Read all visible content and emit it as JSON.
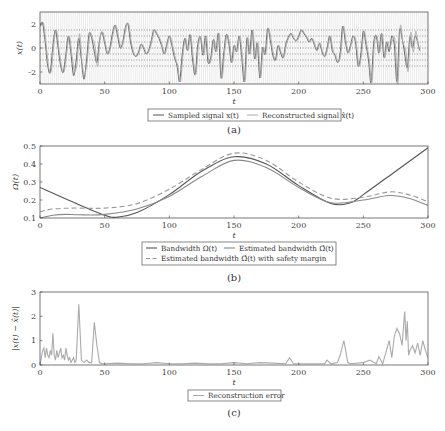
{
  "chart_data": [
    {
      "id": "a",
      "type": "line",
      "caption": "(a)",
      "xlabel": "t",
      "ylabel": "x(t)",
      "xlim": [
        0,
        300
      ],
      "ylim": [
        -3,
        3
      ],
      "xticks": [
        0,
        50,
        100,
        150,
        200,
        250,
        300
      ],
      "yticks": [
        -2,
        0,
        2
      ],
      "grid": "dense vertical sampling lines + dotted horizontal quantization levels",
      "legend": [
        "Sampled signal x(t)",
        "Reconstructed signal x̂(t)"
      ],
      "legend_position": "below",
      "series": [
        {
          "name": "Sampled signal x(t)",
          "color": "#555555",
          "x": [
            0,
            2,
            4,
            6,
            8,
            10,
            12,
            14,
            16,
            18,
            20,
            22,
            24,
            26,
            28,
            30,
            32,
            34,
            36,
            38,
            40,
            42,
            44,
            46,
            48,
            50,
            52,
            54,
            56,
            58,
            60,
            62,
            64,
            66,
            68,
            70,
            72,
            74,
            76,
            78,
            80,
            82,
            84,
            86,
            88,
            90,
            92,
            94,
            96,
            98,
            100,
            102,
            104,
            106,
            108,
            110,
            112,
            114,
            116,
            118,
            120,
            122,
            124,
            126,
            128,
            130,
            132,
            134,
            136,
            138,
            140,
            142,
            144,
            146,
            148,
            150,
            152,
            154,
            156,
            158,
            160,
            162,
            164,
            166,
            168,
            170,
            172,
            174,
            176,
            178,
            180,
            182,
            184,
            186,
            188,
            190,
            192,
            194,
            196,
            198,
            200,
            202,
            204,
            206,
            208,
            210,
            212,
            214,
            216,
            218,
            220,
            222,
            224,
            226,
            228,
            230,
            232,
            234,
            236,
            238,
            240,
            242,
            244,
            246,
            248,
            250,
            252,
            254,
            256,
            258,
            260,
            262,
            264,
            266,
            268,
            270,
            272,
            274,
            276,
            278,
            280,
            282,
            284,
            286,
            288,
            290,
            292,
            294,
            296,
            298,
            300
          ],
          "y": [
            1.8,
            2.1,
            0.5,
            -1.5,
            -2.0,
            0.2,
            1.5,
            0.0,
            -1.5,
            -2.0,
            -0.5,
            1.0,
            -0.5,
            -2.3,
            -1.0,
            0.8,
            -1.0,
            -2.6,
            -1.0,
            1.2,
            0.8,
            -0.3,
            -1.2,
            0.6,
            1.3,
            0.4,
            -0.5,
            0.0,
            1.2,
            1.9,
            1.0,
            0.0,
            0.5,
            1.7,
            2.0,
            0.5,
            -0.4,
            -0.7,
            -0.4,
            0.3,
            0.0,
            -0.5,
            -0.2,
            0.6,
            1.5,
            1.2,
            0.8,
            0.2,
            -0.5,
            0.3,
            1.0,
            0.2,
            -0.8,
            -1.5,
            -2.8,
            -0.5,
            0.8,
            -0.2,
            1.1,
            -1.0,
            -2.2,
            0.3,
            0.9,
            -0.6,
            1.0,
            -1.2,
            -0.8,
            0.7,
            -0.3,
            1.2,
            -2.5,
            -0.5,
            1.1,
            0.4,
            -1.2,
            0.2,
            -0.3,
            1.0,
            -0.8,
            -2.8,
            0.8,
            -0.5,
            1.5,
            -0.9,
            0.4,
            -2.5,
            0.0,
            -0.5,
            1.6,
            0.7,
            -0.6,
            -1.0,
            0.2,
            -0.4,
            -0.8,
            0.3,
            0.9,
            1.2,
            0.8,
            0.6,
            1.0,
            1.5,
            1.2,
            0.9,
            0.5,
            0.8,
            0.3,
            -0.2,
            0.4,
            -0.3,
            -0.7,
            0.0,
            1.0,
            -0.2,
            -0.6,
            -1.2,
            -0.5,
            1.8,
            0.6,
            -0.4,
            0.2,
            1.0,
            0.4,
            -1.5,
            -0.6,
            1.4,
            0.3,
            -1.0,
            -2.9,
            0.4,
            1.0,
            -0.4,
            1.2,
            -0.8,
            0.5,
            -0.3,
            1.0,
            0.2,
            -2.8,
            1.4,
            0.8,
            -0.5,
            -1.6,
            0.9,
            0.0,
            1.0,
            0.5,
            -0.2,
            1.3
          ]
        },
        {
          "name": "Reconstructed signal x̂(t)",
          "color": "#aaaaaa",
          "note": "closely follows sampled signal with deviations near t≈30, 45 and t≈270–300"
        }
      ]
    },
    {
      "id": "b",
      "type": "line",
      "caption": "(b)",
      "xlabel": "t",
      "ylabel": "Ω(t)",
      "xlim": [
        0,
        300
      ],
      "ylim": [
        0.1,
        0.5
      ],
      "xticks": [
        0,
        50,
        100,
        150,
        200,
        250,
        300
      ],
      "yticks": [
        0.1,
        0.2,
        0.3,
        0.4,
        0.5
      ],
      "grid": false,
      "legend": [
        "Bandwidth Ω(t)",
        "Estimated bandwidth Ω̂(t)",
        "Estimated bandwidth Ω̂(t) with safety margin"
      ],
      "legend_position": "below",
      "series": [
        {
          "name": "Bandwidth Ω(t)",
          "color": "#555555",
          "style": "solid",
          "x": [
            0,
            25,
            50,
            60,
            75,
            100,
            125,
            150,
            175,
            200,
            225,
            240,
            250,
            275,
            300
          ],
          "y": [
            0.27,
            0.19,
            0.115,
            0.105,
            0.13,
            0.23,
            0.36,
            0.44,
            0.4,
            0.28,
            0.18,
            0.185,
            0.23,
            0.36,
            0.49
          ]
        },
        {
          "name": "Estimated bandwidth Ω̂(t)",
          "color": "#888888",
          "style": "solid",
          "x": [
            0,
            10,
            20,
            30,
            50,
            75,
            100,
            125,
            150,
            175,
            200,
            225,
            250,
            270,
            285,
            300
          ],
          "y": [
            0.1,
            0.115,
            0.12,
            0.118,
            0.12,
            0.15,
            0.22,
            0.33,
            0.42,
            0.38,
            0.27,
            0.185,
            0.2,
            0.225,
            0.21,
            0.17
          ]
        },
        {
          "name": "Estimated bandwidth Ω̂(t) with safety margin",
          "color": "#999999",
          "style": "dashed",
          "x": [
            0,
            10,
            25,
            50,
            75,
            100,
            125,
            150,
            175,
            200,
            225,
            250,
            270,
            285,
            300
          ],
          "y": [
            0.135,
            0.15,
            0.155,
            0.155,
            0.18,
            0.26,
            0.37,
            0.46,
            0.42,
            0.3,
            0.21,
            0.215,
            0.245,
            0.23,
            0.19
          ]
        }
      ]
    },
    {
      "id": "c",
      "type": "line",
      "caption": "(c)",
      "xlabel": "t",
      "ylabel": "|x(t) − x̂(t)|",
      "xlim": [
        0,
        300
      ],
      "ylim": [
        0,
        3
      ],
      "xticks": [
        0,
        50,
        100,
        150,
        200,
        250,
        300
      ],
      "yticks": [
        0,
        1,
        2,
        3
      ],
      "grid": false,
      "legend": [
        "Reconstruction error"
      ],
      "legend_position": "below",
      "series": [
        {
          "name": "Reconstruction error",
          "color": "#aaaaaa",
          "x": [
            0,
            2,
            3,
            4,
            5,
            6,
            7,
            8,
            9,
            10,
            11,
            12,
            13,
            14,
            15,
            16,
            17,
            18,
            19,
            20,
            21,
            22,
            23,
            24,
            25,
            26,
            27,
            28,
            30,
            32,
            34,
            36,
            38,
            40,
            42,
            44,
            46,
            48,
            50,
            60,
            70,
            80,
            90,
            100,
            110,
            120,
            130,
            140,
            150,
            160,
            170,
            180,
            190,
            193,
            196,
            200,
            210,
            220,
            222,
            225,
            230,
            232,
            235,
            238,
            240,
            250,
            255,
            260,
            262,
            265,
            270,
            272,
            274,
            276,
            278,
            280,
            282,
            283,
            284,
            285,
            286,
            288,
            290,
            292,
            294,
            296,
            298,
            300
          ],
          "y": [
            0,
            0.6,
            0.7,
            0.3,
            0.7,
            0.4,
            0.3,
            0.6,
            0.4,
            1.3,
            0.4,
            0.2,
            0.6,
            0.3,
            0.5,
            0.7,
            0.3,
            0.4,
            0.2,
            0.7,
            0.4,
            0.2,
            0.3,
            0.1,
            0.2,
            0.3,
            0.1,
            0.2,
            2.5,
            0.2,
            0.1,
            0.2,
            0.1,
            0.1,
            1.75,
            0.8,
            0.1,
            0.05,
            0.05,
            0.08,
            0.05,
            0.05,
            0.1,
            0.05,
            0.05,
            0.08,
            0.05,
            0.05,
            0.1,
            0.05,
            0.1,
            0.08,
            0.05,
            0.3,
            0.05,
            0.05,
            0.05,
            0.05,
            0.2,
            0.05,
            0.1,
            0.4,
            1.0,
            0.1,
            0.05,
            0.1,
            0.2,
            0.05,
            0.35,
            0.05,
            1.0,
            0.3,
            1.2,
            1.5,
            1.3,
            0.8,
            2.2,
            1.0,
            1.8,
            0.4,
            0.6,
            0.8,
            0.5,
            0.9,
            0.4,
            1.0,
            0.6,
            0.3
          ]
        }
      ]
    }
  ]
}
